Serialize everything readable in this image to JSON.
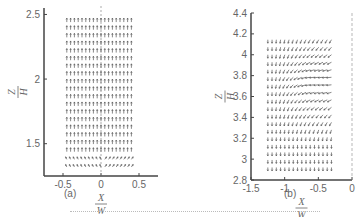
{
  "chart_data": [
    {
      "type": "vector_field",
      "panel_label": "(a)",
      "xlabel": "X/W",
      "ylabel": "Z/H",
      "xlim": [
        -0.75,
        0.75
      ],
      "ylim": [
        1.25,
        2.55
      ],
      "xticks": [
        "-0.5",
        "0",
        "0.5"
      ],
      "yticks": [
        "1.5",
        "2",
        "2.5"
      ],
      "grid": false,
      "description": "Upward-pointing velocity vectors across x=-0.45..0.4, z=1.3..2.45, dashed centerline at x=0"
    },
    {
      "type": "vector_field",
      "panel_label": "(b)",
      "xlabel": "X/W",
      "ylabel": "Z/H",
      "xlim": [
        -1.5,
        0
      ],
      "ylim": [
        2.8,
        4.4
      ],
      "xticks": [
        "-1.5",
        "-1",
        "-0.5",
        "0"
      ],
      "yticks": [
        "2.8",
        "3",
        "3.2",
        "3.4",
        "3.6",
        "3.8",
        "4",
        "4.2",
        "4.4"
      ],
      "grid": false,
      "description": "Vectors pointing down on left, turning leftward (horizontal) at right/middle heights, dashed line at x=0"
    }
  ],
  "panels": {
    "a": {
      "label": "(a)",
      "x_num": "X",
      "x_den": "W",
      "y_num": "Z",
      "y_den": "H"
    },
    "b": {
      "label": "(b)",
      "x_num": "X",
      "x_den": "W",
      "y_num": "Z",
      "y_den": "H"
    }
  }
}
